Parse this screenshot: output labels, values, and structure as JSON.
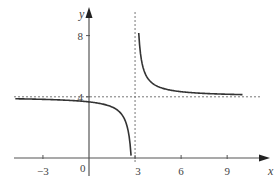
{
  "chart_data": {
    "type": "line",
    "title": "",
    "xlabel": "x",
    "ylabel": "y",
    "function": "y = 4 + 1/(x - 3)",
    "xlim": [
      -4.8,
      10.8
    ],
    "ylim": [
      -1.4,
      10.3
    ],
    "x_ticks": [
      -3,
      3,
      6,
      9
    ],
    "x_tick_labels": [
      "−3",
      "3",
      "6",
      "9"
    ],
    "y_ticks": [
      4,
      8
    ],
    "y_tick_labels": [
      "4",
      "8"
    ],
    "origin_label": "0",
    "grid": false,
    "asymptotes": {
      "vertical": {
        "x": 3,
        "style": "dashed"
      },
      "horizontal": {
        "y": 4,
        "style": "dashed"
      }
    },
    "series": [
      {
        "name": "left branch",
        "x": [
          -4.8,
          -3,
          -2,
          -1,
          0,
          1,
          2,
          2.5,
          2.75
        ],
        "y": [
          3.87,
          3.83,
          3.8,
          3.75,
          3.67,
          3.5,
          3.0,
          2.0,
          0.0
        ]
      },
      {
        "name": "right branch",
        "x": [
          3.25,
          3.5,
          4,
          5,
          6,
          7,
          8,
          9,
          10
        ],
        "y": [
          8.0,
          6.0,
          5.0,
          4.5,
          4.33,
          4.25,
          4.2,
          4.17,
          4.14
        ]
      }
    ],
    "colors": {
      "axis": "#555555",
      "curve": "#333333",
      "asymptote": "#777777"
    }
  }
}
